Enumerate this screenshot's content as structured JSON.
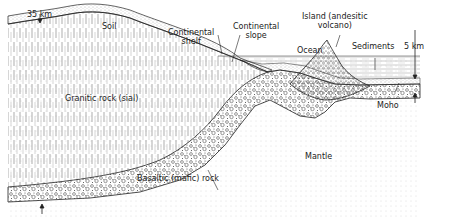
{
  "diagram": {
    "type": "geologic-cross-section",
    "labels": {
      "crust_thickness_continent": "35 km",
      "soil": "Soil",
      "continental_shelf_line1": "Continental",
      "continental_shelf_line2": "shelf",
      "continental_slope_line1": "Continental",
      "continental_slope_line2": "slope",
      "ocean": "Ocean",
      "island_line1": "Island (andesitic",
      "island_line2": "volcano)",
      "sediments": "Sediments",
      "crust_thickness_ocean": "5 km",
      "granitic_rock": "Granitic rock (sial)",
      "moho": "Moho",
      "mantle": "Mantle",
      "basaltic_rock": "Basaltic (mafic) rock"
    },
    "colors": {
      "line": "#222222",
      "ocean": "#bbbbbb",
      "mantle_dots": "#c8c8c8",
      "background": "#ffffff"
    }
  }
}
